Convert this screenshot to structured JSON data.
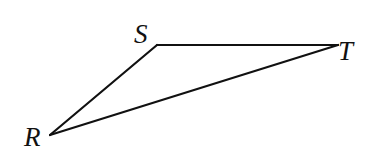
{
  "diagram": {
    "type": "triangle",
    "vertices": [
      {
        "id": "S",
        "label": "S",
        "x": 157,
        "y": 45,
        "label_x": 134,
        "label_y": 43
      },
      {
        "id": "T",
        "label": "T",
        "x": 338,
        "y": 45,
        "label_x": 338,
        "label_y": 60
      },
      {
        "id": "R",
        "label": "R",
        "x": 50,
        "y": 135,
        "label_x": 24,
        "label_y": 146
      }
    ],
    "edges": [
      {
        "from": "S",
        "to": "T"
      },
      {
        "from": "T",
        "to": "R"
      },
      {
        "from": "R",
        "to": "S"
      }
    ],
    "stroke_color": "#111111",
    "background": "#ffffff"
  }
}
